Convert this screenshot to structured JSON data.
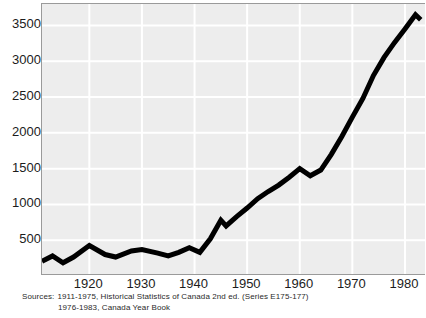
{
  "chart_data": {
    "type": "line",
    "title": "",
    "subtitle": "",
    "xlabel": "",
    "ylabel": "",
    "xlim": [
      1911,
      1984
    ],
    "ylim": [
      0,
      3800
    ],
    "grid": true,
    "legend": "none",
    "x_ticks": [
      "1920",
      "1930",
      "1940",
      "1950",
      "1960",
      "1970",
      "1980"
    ],
    "x_tick_values": [
      1920,
      1930,
      1940,
      1950,
      1960,
      1970,
      1980
    ],
    "y_ticks": [
      "500",
      "1000",
      "1500",
      "2000",
      "2500",
      "3000",
      "3500"
    ],
    "y_tick_values": [
      500,
      1000,
      1500,
      2000,
      2500,
      3000,
      3500
    ],
    "series": [
      {
        "name": "Series E175-177",
        "color": "#000000",
        "x": [
          1911,
          1913,
          1915,
          1917,
          1920,
          1923,
          1925,
          1928,
          1930,
          1933,
          1935,
          1937,
          1939,
          1941,
          1943,
          1945,
          1946,
          1948,
          1950,
          1952,
          1954,
          1956,
          1958,
          1960,
          1962,
          1964,
          1966,
          1968,
          1970,
          1972,
          1974,
          1976,
          1978,
          1980,
          1982,
          1983
        ],
        "y": [
          205,
          280,
          185,
          265,
          425,
          300,
          265,
          350,
          370,
          320,
          280,
          330,
          395,
          330,
          520,
          780,
          700,
          830,
          950,
          1080,
          1180,
          1270,
          1380,
          1500,
          1400,
          1480,
          1700,
          1950,
          2220,
          2480,
          2800,
          3050,
          3260,
          3450,
          3650,
          3580
        ]
      }
    ]
  },
  "axis": {
    "y_label_color": "#1c1c1c",
    "x_label_color": "#1c1c1c"
  },
  "style": {
    "plot_background": "#ededed",
    "grid_color": "#ffffff",
    "frame_color": "#9a9a9a",
    "line_color": "#000000",
    "page_background": "#ffffff"
  },
  "sources": {
    "label": "Sources:",
    "line1": "1911-1975, Historical Statistics of Canada 2nd ed. (Series E175-177)",
    "line2": "1976-1983, Canada Year Book"
  }
}
